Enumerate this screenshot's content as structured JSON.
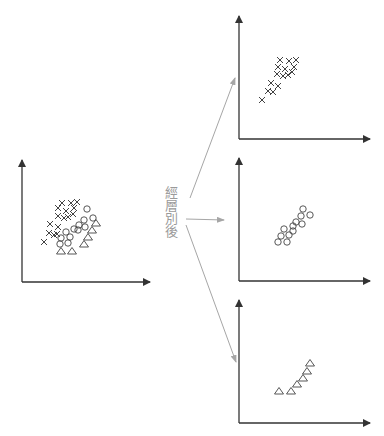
{
  "diagram": {
    "label": "經層別後",
    "colors": {
      "axis": "#333333",
      "marker": "#444444",
      "arrow": "#a6a6a6",
      "label": "#9a9a9a"
    }
  },
  "chart_data": [
    {
      "name": "combined",
      "type": "scatter",
      "title": "",
      "xlabel": "",
      "ylabel": "",
      "axes": {
        "x0": 22,
        "y0": 282,
        "x_end": 150,
        "y_top": 160
      },
      "series": [
        {
          "name": "cross",
          "marker": "x",
          "points": [
            [
              62,
              203
            ],
            [
              71,
              203
            ],
            [
              77,
              202
            ],
            [
              58,
              208
            ],
            [
              66,
              211
            ],
            [
              74,
              208
            ],
            [
              58,
              216
            ],
            [
              64,
              218
            ],
            [
              68,
              217
            ],
            [
              73,
              214
            ],
            [
              50,
              224
            ],
            [
              58,
              227
            ],
            [
              49,
              233
            ],
            [
              54,
              235
            ],
            [
              44,
              242
            ],
            [
              57,
              234
            ]
          ]
        },
        {
          "name": "circle",
          "marker": "o",
          "points": [
            [
              87,
              209
            ],
            [
              93,
              218
            ],
            [
              84,
              220
            ],
            [
              79,
              225
            ],
            [
              74,
              229
            ],
            [
              85,
              227
            ],
            [
              66,
              232
            ],
            [
              78,
              230
            ],
            [
              61,
              238
            ],
            [
              70,
              237
            ],
            [
              60,
              244
            ],
            [
              68,
              243
            ]
          ]
        },
        {
          "name": "triangle",
          "marker": "^",
          "points": [
            [
              96,
              223
            ],
            [
              92,
              230
            ],
            [
              88,
              237
            ],
            [
              84,
              244
            ],
            [
              72,
              251
            ],
            [
              61,
              251
            ]
          ]
        }
      ]
    },
    {
      "name": "stratum-cross",
      "type": "scatter",
      "axes": {
        "x0": 239,
        "y0": 139,
        "x_end": 370,
        "y_top": 16
      },
      "series": [
        {
          "name": "cross",
          "marker": "x",
          "points": [
            [
              280,
              60
            ],
            [
              289,
              61
            ],
            [
              296,
              60
            ],
            [
              278,
              67
            ],
            [
              285,
              69
            ],
            [
              294,
              67
            ],
            [
              277,
              74
            ],
            [
              283,
              76
            ],
            [
              288,
              75
            ],
            [
              292,
              72
            ],
            [
              271,
              83
            ],
            [
              278,
              86
            ],
            [
              268,
              91
            ],
            [
              273,
              92
            ],
            [
              262,
              100
            ]
          ]
        }
      ]
    },
    {
      "name": "stratum-circle",
      "type": "scatter",
      "axes": {
        "x0": 239,
        "y0": 281,
        "x_end": 370,
        "y_top": 158
      },
      "series": [
        {
          "name": "circle",
          "marker": "o",
          "points": [
            [
              303,
              209
            ],
            [
              310,
              215
            ],
            [
              301,
              216
            ],
            [
              296,
              222
            ],
            [
              293,
              226
            ],
            [
              302,
              224
            ],
            [
              284,
              229
            ],
            [
              293,
              231
            ],
            [
              281,
              236
            ],
            [
              289,
              235
            ],
            [
              278,
              242
            ],
            [
              287,
              242
            ]
          ]
        }
      ]
    },
    {
      "name": "stratum-triangle",
      "type": "scatter",
      "axes": {
        "x0": 239,
        "y0": 423,
        "x_end": 370,
        "y_top": 300
      },
      "series": [
        {
          "name": "triangle",
          "marker": "^",
          "points": [
            [
              310,
              363
            ],
            [
              307,
              371
            ],
            [
              303,
              378
            ],
            [
              297,
              384
            ],
            [
              291,
              391
            ],
            [
              279,
              391
            ]
          ]
        }
      ]
    }
  ],
  "arrows": [
    {
      "from": [
        190,
        198
      ],
      "to": [
        235,
        78
      ]
    },
    {
      "from": [
        186,
        219
      ],
      "to": [
        224,
        220
      ]
    },
    {
      "from": [
        186,
        225
      ],
      "to": [
        236,
        362
      ]
    }
  ]
}
